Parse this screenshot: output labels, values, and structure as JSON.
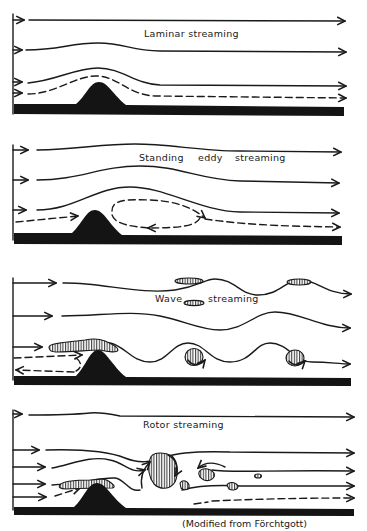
{
  "panels": [
    {
      "id": "laminar",
      "title": "Laminar streaming"
    },
    {
      "id": "standing-eddy",
      "title_parts": [
        "Standing",
        "eddy",
        "streaming"
      ]
    },
    {
      "id": "wave",
      "title_parts": [
        "Wave",
        "streaming"
      ]
    },
    {
      "id": "rotor",
      "title": "Rotor streaming"
    }
  ],
  "caption": "(Modified from Förchtgott)",
  "colors": {
    "ink": "#1a1a1a",
    "ground": "#141414",
    "background": "#ffffff"
  }
}
